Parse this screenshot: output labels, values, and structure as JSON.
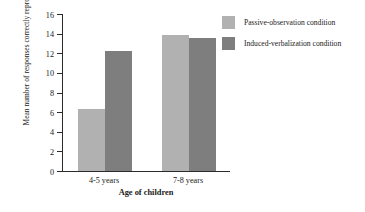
{
  "chart_data": {
    "type": "bar",
    "title": "",
    "xlabel": "Age of children",
    "ylabel": "Mean number of responses correctly reproduced",
    "categories": [
      "4-5 years",
      "7-8 years"
    ],
    "series": [
      {
        "name": "Passive-observation condition",
        "color": "#b1b1b1",
        "values": [
          6.3,
          13.9
        ]
      },
      {
        "name": "Induced-verbalization condition",
        "color": "#7e7e7e",
        "values": [
          12.2,
          13.6
        ]
      }
    ],
    "ylim": [
      0,
      16
    ],
    "ytick_step": 2,
    "yticks": [
      "16",
      "14",
      "12",
      "10",
      "8",
      "6",
      "4",
      "2",
      "0"
    ],
    "grid": false,
    "legend_position": "top-right"
  },
  "axis": {
    "color": "#2b2b2b"
  }
}
